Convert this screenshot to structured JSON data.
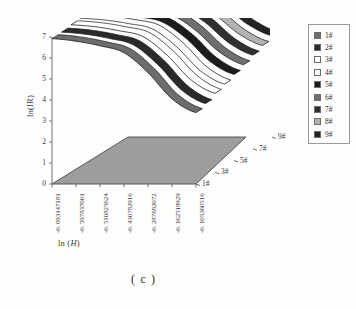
{
  "caption": "( c )",
  "axes": {
    "y_label": "ln(IR)",
    "y_ticks": [
      "0",
      "1",
      "2",
      "3",
      "4",
      "5",
      "6",
      "7"
    ],
    "x_label_prefix": "ln (",
    "x_label_var": "H",
    "x_label_suffix": ")",
    "x_ticks": [
      "-0. 693147181",
      "-0. 597837001",
      "-0. 510825624",
      "-0. 430782916",
      "-0. 287682072",
      "-0. 162518929",
      "-0. 105360516"
    ],
    "z_ticks": [
      "1#",
      "3#",
      "5#",
      "7#",
      "9#"
    ]
  },
  "legend": {
    "items": [
      {
        "label": "1#",
        "color": "#6e6e6e"
      },
      {
        "label": "2#",
        "color": "#2a2a2a"
      },
      {
        "label": "3#",
        "color": "#ffffff"
      },
      {
        "label": "4#",
        "color": "#fcfcfc"
      },
      {
        "label": "5#",
        "color": "#1c1c1c"
      },
      {
        "label": "6#",
        "color": "#707070"
      },
      {
        "label": "7#",
        "color": "#303030"
      },
      {
        "label": "8#",
        "color": "#b4b4b4"
      },
      {
        "label": "9#",
        "color": "#232323"
      }
    ]
  },
  "style": {
    "floor_fill": "#9e9e9e",
    "floor_stroke": "#4a4a4a",
    "axis_color": "#7a7a7a",
    "ribbon_edge": "#1a1a1a"
  },
  "chart_data": {
    "type": "line",
    "title": "",
    "subtitle": "",
    "xlabel": "ln (H)",
    "ylabel": "ln(IR)",
    "zlabel": "sample",
    "projection": "3d-ribbon",
    "grid": false,
    "legend_position": "right",
    "xlim": [
      -0.693147181,
      -0.105360516
    ],
    "ylim": [
      0,
      7
    ],
    "x": [
      -0.693147181,
      -0.597837001,
      -0.510825624,
      -0.430782916,
      -0.287682072,
      -0.162518929,
      -0.105360516
    ],
    "x_tick_labels": [
      "-0. 693147181",
      "-0. 597837001",
      "-0. 510825624",
      "-0. 430782916",
      "-0. 287682072",
      "-0. 162518929",
      "-0. 105360516"
    ],
    "y_tick_labels": [
      "0",
      "1",
      "2",
      "3",
      "4",
      "5",
      "6",
      "7"
    ],
    "z_categories": [
      "1#",
      "2#",
      "3#",
      "4#",
      "5#",
      "6#",
      "7#",
      "8#",
      "9#"
    ],
    "z_tick_labels": [
      "1#",
      "3#",
      "5#",
      "7#",
      "9#"
    ],
    "series": [
      {
        "name": "1#",
        "color": "#6e6e6e",
        "values": [
          6.92,
          6.8,
          6.58,
          6.25,
          5.3,
          4.05,
          3.4
        ]
      },
      {
        "name": "2#",
        "color": "#2a2a2a",
        "values": [
          6.95,
          6.85,
          6.65,
          6.34,
          5.42,
          4.2,
          3.55
        ]
      },
      {
        "name": "3#",
        "color": "#ffffff",
        "values": [
          7.02,
          6.93,
          6.74,
          6.46,
          5.58,
          4.4,
          3.76
        ]
      },
      {
        "name": "4#",
        "color": "#fcfcfc",
        "values": [
          7.05,
          6.97,
          6.8,
          6.54,
          5.7,
          4.55,
          3.92
        ]
      },
      {
        "name": "5#",
        "color": "#1c1c1c",
        "values": [
          7.08,
          7.0,
          6.84,
          6.6,
          5.82,
          4.72,
          4.1
        ]
      },
      {
        "name": "6#",
        "color": "#707070",
        "values": [
          7.1,
          7.03,
          6.88,
          6.66,
          5.92,
          4.88,
          4.28
        ]
      },
      {
        "name": "7#",
        "color": "#303030",
        "values": [
          7.12,
          7.06,
          6.92,
          6.72,
          6.02,
          5.04,
          4.46
        ]
      },
      {
        "name": "8#",
        "color": "#b4b4b4",
        "values": [
          7.14,
          7.08,
          6.95,
          6.77,
          6.12,
          5.2,
          4.64
        ]
      },
      {
        "name": "9#",
        "color": "#232323",
        "values": [
          7.16,
          7.1,
          6.98,
          6.82,
          6.22,
          5.36,
          4.82
        ]
      }
    ]
  }
}
